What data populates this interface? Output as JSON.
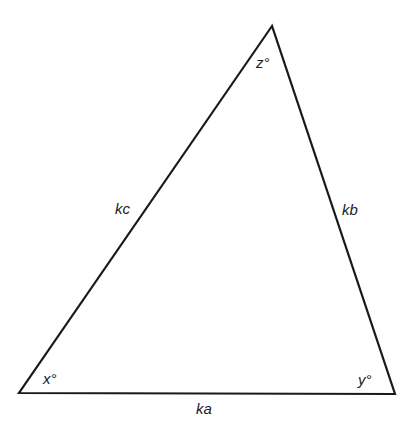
{
  "diagram": {
    "type": "triangle",
    "vertices": {
      "top": [
        272,
        26
      ],
      "bottom_left": [
        19,
        393
      ],
      "bottom_right": [
        395,
        394
      ]
    },
    "stroke_color": "#1a1a1a",
    "angles": {
      "top": "z°",
      "bottom_left": "x°",
      "bottom_right": "y°"
    },
    "sides": {
      "left": "kc",
      "right": "kb",
      "bottom": "ka"
    }
  }
}
